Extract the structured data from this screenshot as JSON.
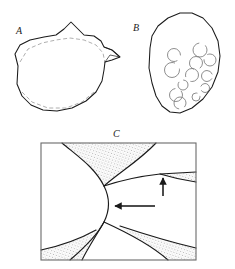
{
  "plate": {
    "background_color": "#ffffff",
    "ink_color": "#1a1a1a",
    "dashed_color": "#8a8a8a",
    "stipple_color": "#555555",
    "width": 235,
    "height": 269
  },
  "panels": [
    {
      "id": "A",
      "label": "A",
      "caption_position": "upper-left",
      "description": "irregular rounded outline with apical peak, right-side spur and faint dashed inner contour",
      "outline": "M 18,66 L 15,54 L 20,45 L 30,40 L 44,37 L 56,35 L 64,29 L 71,22 L 78,29 L 84,35 L 94,36 L 101,41 L 104,47 L 112,50 L 120,57 L 112,60 L 105,62 L 104,70 L 102,81 L 96,92 L 86,101 L 72,108 L 57,111 L 43,110 L 31,105 L 22,96 L 17,84 Z",
      "dashed": "M 20,62 L 28,49 L 42,43 L 56,40 L 70,38 L 84,40 L 96,45 L 103,53 L 105,63 M 22,92 L 32,102 L 48,108 L 66,108 L 82,102 L 94,92"
    },
    {
      "id": "B",
      "label": "B",
      "caption_position": "upper-left",
      "description": "ovoid grain outline containing scattered open crescent-shaped inclusions",
      "outline": "M 150,48 L 152,36 L 158,26 L 168,18 L 180,13 L 192,13 L 203,18 L 212,28 L 218,41 L 220,56 L 218,72 L 212,87 L 203,99 L 192,108 L 180,113 L 170,112 L 162,106 L 156,96 L 152,83 L 149,68 Z",
      "inclusions": [
        {
          "cx": 174,
          "cy": 55,
          "r": 6.5,
          "gap_deg": 300
        },
        {
          "cx": 200,
          "cy": 50,
          "r": 7.0,
          "gap_deg": 40
        },
        {
          "cx": 210,
          "cy": 60,
          "r": 6.0,
          "gap_deg": 120
        },
        {
          "cx": 196,
          "cy": 63,
          "r": 6.5,
          "gap_deg": 250
        },
        {
          "cx": 172,
          "cy": 70,
          "r": 7.5,
          "gap_deg": 10
        },
        {
          "cx": 192,
          "cy": 75,
          "r": 6.5,
          "gap_deg": 200
        },
        {
          "cx": 207,
          "cy": 76,
          "r": 5.5,
          "gap_deg": 330
        },
        {
          "cx": 183,
          "cy": 85,
          "r": 5.0,
          "gap_deg": 90
        },
        {
          "cx": 205,
          "cy": 88,
          "r": 4.5,
          "gap_deg": 160
        },
        {
          "cx": 176,
          "cy": 95,
          "r": 6.5,
          "gap_deg": 45
        },
        {
          "cx": 180,
          "cy": 103,
          "r": 6.0,
          "gap_deg": 260
        },
        {
          "cx": 196,
          "cy": 97,
          "r": 4.0,
          "gap_deg": 20
        }
      ]
    },
    {
      "id": "C",
      "label": "C",
      "caption_position": "top-center",
      "description": "rectangular field showing curved grain boundaries meeting at triple junctions with stippled second-phase wedges; two arrows mark features",
      "frame": {
        "x": 41,
        "y": 143,
        "width": 155,
        "height": 117
      },
      "boundaries": [
        "M 62,143 C 80,158 95,168 104,186 C 110,198 110,210 104,222 C 97,236 84,248 70,260",
        "M 104,186 C 122,180 142,176 160,174 L 196,172",
        "M 104,222 C 126,232 150,244 168,260",
        "M 104,222 C 96,236 88,248 82,260",
        "M 104,186 C 120,172 140,160 156,143",
        "M 41,250 C 60,246 78,240 96,230",
        "M 196,182 C 182,180 170,177 160,174",
        "M 196,248 C 170,242 144,234 120,226"
      ],
      "stipple_regions": [
        "M 62,143 C 80,158 95,168 104,186 C 120,172 140,160 156,143 Z",
        "M 160,174 L 196,172 L 196,182 C 182,180 170,177 160,174 Z",
        "M 41,250 C 60,246 78,240 96,230 L 104,222 C 96,236 88,248 82,260 L 41,260 Z",
        "M 120,226 C 144,234 170,242 196,248 L 196,260 L 168,260 C 150,244 126,232 120,226 Z"
      ],
      "arrows": [
        {
          "name": "horizontal-arrow",
          "direction": "left",
          "x1": 155,
          "y1": 206,
          "x2": 113,
          "y2": 206
        },
        {
          "name": "vertical-arrow",
          "direction": "up",
          "x1": 163,
          "y1": 196,
          "x2": 163,
          "y2": 176
        }
      ]
    }
  ]
}
